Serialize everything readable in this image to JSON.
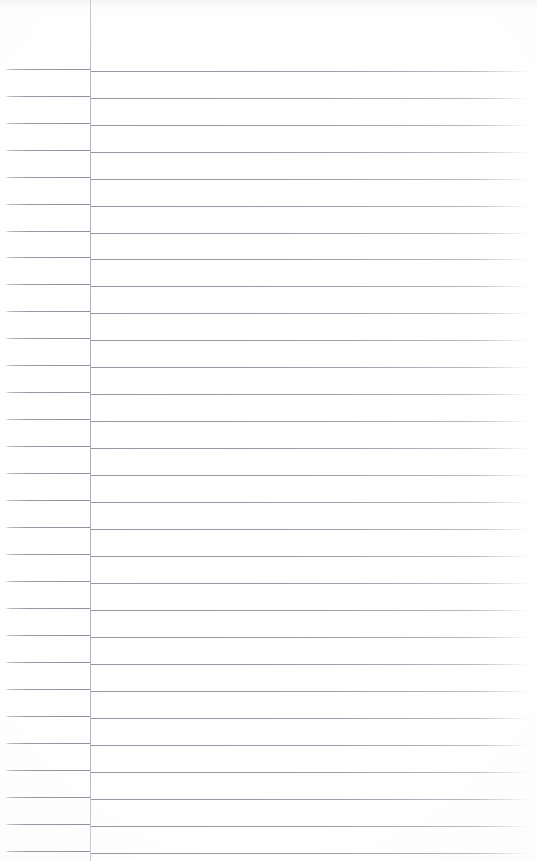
{
  "document": {
    "type": "scanned-lined-notebook-page",
    "title": "Blank Ruled Notebook Page",
    "content_text": "",
    "is_blank": true,
    "page_width": 537,
    "page_height": 861
  },
  "colors": {
    "paper": "#fdfdfd",
    "rule_line": "#9696a2",
    "margin_rule": "#acacb6",
    "page_edge": "#f7f7f8"
  },
  "layout": {
    "margin_rule_x": 90,
    "rule_start_x": 5,
    "rule_end_x": 528,
    "first_rule_y": 71,
    "rule_spacing": 26.93,
    "rule_count": 30,
    "left_segment_skew": -2
  },
  "ruled_lines": [
    {
      "index": 1,
      "y": 71
    },
    {
      "index": 2,
      "y": 98
    },
    {
      "index": 3,
      "y": 125
    },
    {
      "index": 4,
      "y": 152
    },
    {
      "index": 5,
      "y": 179
    },
    {
      "index": 6,
      "y": 206
    },
    {
      "index": 7,
      "y": 233
    },
    {
      "index": 8,
      "y": 259
    },
    {
      "index": 9,
      "y": 286
    },
    {
      "index": 10,
      "y": 313
    },
    {
      "index": 11,
      "y": 340
    },
    {
      "index": 12,
      "y": 367
    },
    {
      "index": 13,
      "y": 394
    },
    {
      "index": 14,
      "y": 421
    },
    {
      "index": 15,
      "y": 448
    },
    {
      "index": 16,
      "y": 475
    },
    {
      "index": 17,
      "y": 502
    },
    {
      "index": 18,
      "y": 529
    },
    {
      "index": 19,
      "y": 556
    },
    {
      "index": 20,
      "y": 583
    },
    {
      "index": 21,
      "y": 610
    },
    {
      "index": 22,
      "y": 637
    },
    {
      "index": 23,
      "y": 664
    },
    {
      "index": 24,
      "y": 691
    },
    {
      "index": 25,
      "y": 718
    },
    {
      "index": 26,
      "y": 745
    },
    {
      "index": 27,
      "y": 772
    },
    {
      "index": 28,
      "y": 799
    },
    {
      "index": 29,
      "y": 826
    },
    {
      "index": 30,
      "y": 853
    }
  ]
}
